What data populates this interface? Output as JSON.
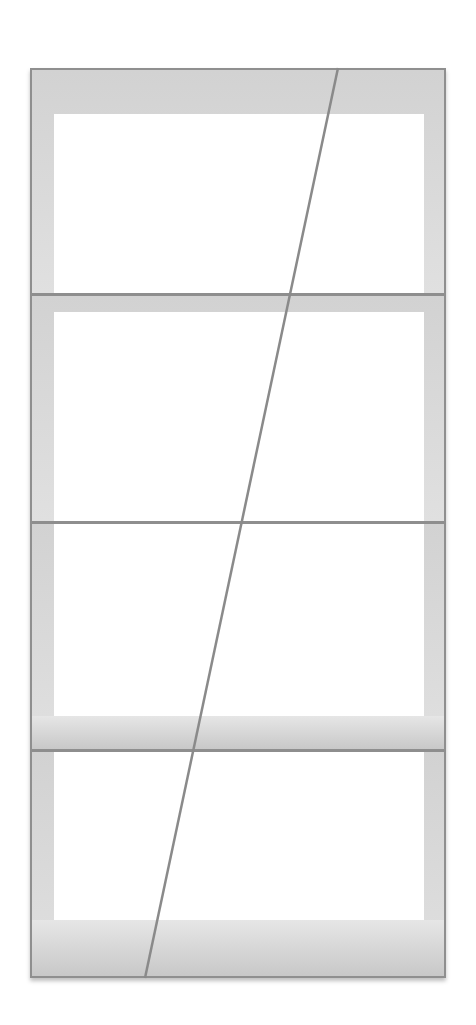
{
  "image": {
    "subject": "white wall shelving unit with four open compartments and diagonal rod",
    "colors": {
      "background": "#ffffff",
      "frame": "#8f8f8f",
      "side_shading": "#dcdcdc",
      "inner_panel": "#ffffff",
      "rod": "#8a8a8a"
    },
    "compartments": 4,
    "shelf_count": 3
  }
}
